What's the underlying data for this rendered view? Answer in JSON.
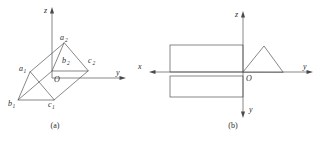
{
  "figure": {
    "title_a_caption": "(a)",
    "title_b_caption": "(b)",
    "panel_a": {
      "name": "axonometric-prism",
      "axes": [
        {
          "id": "z",
          "label": "z",
          "direction": "up"
        },
        {
          "id": "y",
          "label": "y",
          "direction": "right"
        }
      ],
      "origin_label": "O",
      "vertex_labels": [
        {
          "id": "a2",
          "base": "a",
          "sub": "2"
        },
        {
          "id": "b2",
          "base": "b",
          "sub": "2"
        },
        {
          "id": "c2",
          "base": "c",
          "sub": "2"
        },
        {
          "id": "a1",
          "base": "a",
          "sub": "1"
        },
        {
          "id": "b1",
          "base": "b",
          "sub": "1"
        },
        {
          "id": "c1",
          "base": "c",
          "sub": "1"
        }
      ]
    },
    "panel_b": {
      "name": "orthographic-projections",
      "axes": [
        {
          "id": "z",
          "label": "z",
          "direction": "up"
        },
        {
          "id": "y",
          "label": "y",
          "direction": "right"
        },
        {
          "id": "x-left",
          "label": "x",
          "direction": "left"
        },
        {
          "id": "y-down",
          "label": "y",
          "direction": "down"
        }
      ],
      "origin_label": "O"
    }
  },
  "colors": {
    "line": "#555555",
    "axis": "#6b6b6b",
    "text": "#2b2b2b",
    "background": "#ffffff"
  }
}
